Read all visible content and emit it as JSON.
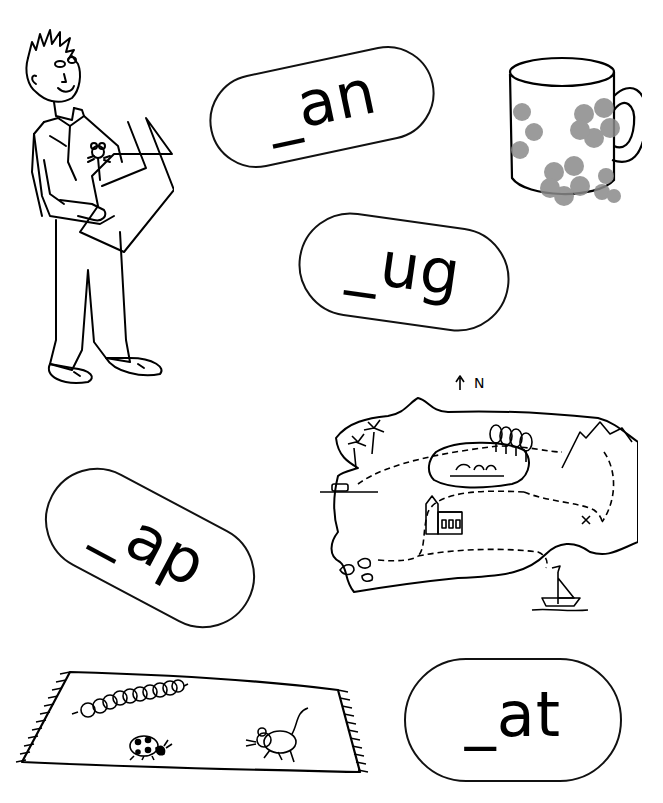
{
  "worksheet": {
    "cards": [
      {
        "id": "an",
        "label": "_an"
      },
      {
        "id": "ug",
        "label": "_ug"
      },
      {
        "id": "ap",
        "label": "_ap"
      },
      {
        "id": "at",
        "label": "_at"
      }
    ],
    "pictures": [
      {
        "id": "man",
        "description": "man holding a map with a mouse in his pocket"
      },
      {
        "id": "mug",
        "description": "mug with flower pattern"
      },
      {
        "id": "map",
        "description": "treasure map of an island",
        "compass_label": "N"
      },
      {
        "id": "mat",
        "description": "rug with a caterpillar, ladybird and mouse"
      }
    ]
  }
}
